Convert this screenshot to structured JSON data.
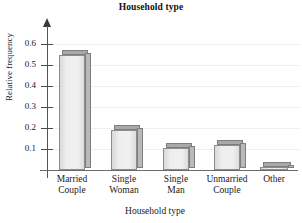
{
  "chart_data": {
    "type": "bar",
    "title": "Household type",
    "xlabel": "Household type",
    "ylabel": "Relative frequency",
    "categories": [
      "Married Couple",
      "Single Woman",
      "Single Man",
      "Unmarried Couple",
      "Other"
    ],
    "category_lines": [
      [
        "Married",
        "Couple"
      ],
      [
        "Single",
        "Woman"
      ],
      [
        "Single",
        "Man"
      ],
      [
        "Unmarried",
        "Couple"
      ],
      [
        "Other"
      ]
    ],
    "values": [
      0.55,
      0.19,
      0.105,
      0.12,
      0.015
    ],
    "ylim": [
      0,
      0.65
    ],
    "yticks": [
      0.1,
      0.2,
      0.3,
      0.4,
      0.5,
      0.6
    ],
    "ytick_labels": [
      "0.1",
      "0.2",
      "0.3",
      "0.4",
      "0.5",
      "0.6"
    ],
    "grid": true,
    "grid_color": "#efefef",
    "legend": null,
    "bar_style": "3d-shaded",
    "bar_face_color": "#ececec",
    "bar_edge_color": "#8d8d8d",
    "bar_top_color": "#a9a9a9",
    "bar_side_color": "#b9b9b9",
    "axis_color": "#555555"
  }
}
